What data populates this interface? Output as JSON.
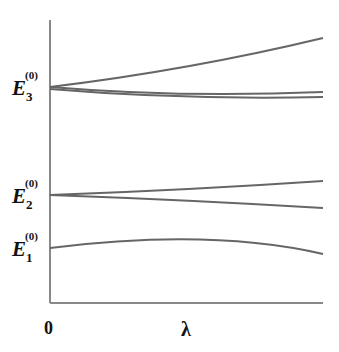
{
  "diagram": {
    "type": "energy-level-splitting",
    "x_axis": {
      "label": "λ",
      "origin_label": "0"
    },
    "levels": [
      {
        "name": "E",
        "subscript": "3",
        "superscript": "(0)",
        "y": 87,
        "curves": [
          {
            "d": "M50,87 Q190,70 323,38"
          },
          {
            "d": "M50,87 Q180,98 323,92"
          },
          {
            "d": "M50,89 Q180,100 323,97"
          }
        ]
      },
      {
        "name": "E",
        "subscript": "2",
        "superscript": "(0)",
        "y": 195,
        "curves": [
          {
            "d": "M50,195 Q190,190 323,181"
          },
          {
            "d": "M50,195 Q190,200 323,208"
          }
        ]
      },
      {
        "name": "E",
        "subscript": "1",
        "superscript": "(0)",
        "y": 248,
        "curves": [
          {
            "d": "M50,248 Q210,228 323,254"
          }
        ]
      }
    ],
    "colors": {
      "axis": "#888888",
      "curve": "#666666",
      "text": "#111111"
    }
  }
}
